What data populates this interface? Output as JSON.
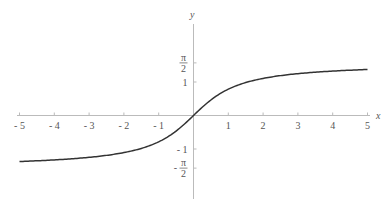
{
  "chart_data": {
    "type": "line",
    "title": "",
    "function": "y = arctan(x)",
    "xlabel": "x",
    "ylabel": "y",
    "xlim": [
      -5,
      5
    ],
    "ylim": [
      -2.4,
      2.7
    ],
    "grid": false,
    "x_ticks": [
      {
        "value": -5,
        "label": "- 5"
      },
      {
        "value": -4,
        "label": "- 4"
      },
      {
        "value": -3,
        "label": "- 3"
      },
      {
        "value": -2,
        "label": "- 2"
      },
      {
        "value": -1,
        "label": "- 1"
      },
      {
        "value": 1,
        "label": "1"
      },
      {
        "value": 2,
        "label": "2"
      },
      {
        "value": 3,
        "label": "3"
      },
      {
        "value": 4,
        "label": "4"
      },
      {
        "value": 5,
        "label": "5"
      }
    ],
    "y_ticks": [
      {
        "value": 1.5708,
        "label_num": "π",
        "label_den": "2",
        "sign": ""
      },
      {
        "value": 1,
        "label": "1"
      },
      {
        "value": -1,
        "label": "- 1"
      },
      {
        "value": -1.5708,
        "label_num": "π",
        "label_den": "2",
        "sign": "-"
      }
    ],
    "series": [
      {
        "name": "arctan(x)",
        "color": "#333333",
        "x": [
          -5,
          -4,
          -3,
          -2,
          -1.5,
          -1,
          -0.5,
          0,
          0.5,
          1,
          1.5,
          2,
          3,
          4,
          5
        ],
        "y": [
          -1.373,
          -1.326,
          -1.249,
          -1.107,
          -0.983,
          -0.785,
          -0.464,
          0,
          0.464,
          0.785,
          0.983,
          1.107,
          1.249,
          1.326,
          1.373
        ]
      }
    ]
  },
  "colors": {
    "axis": "#bbbbbb",
    "curve": "#333333",
    "text": "#555555"
  }
}
